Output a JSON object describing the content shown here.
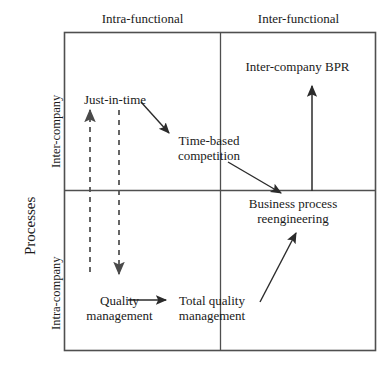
{
  "diagram": {
    "title_axis_y": "Processes",
    "axis_y_categories": [
      {
        "id": "inter-company",
        "label": "Inter-company"
      },
      {
        "id": "intra-company",
        "label": "Intra-company"
      }
    ],
    "axis_x_categories": [
      {
        "id": "intra-functional",
        "label": "Intra-functional"
      },
      {
        "id": "inter-functional",
        "label": "Inter-functional"
      }
    ],
    "nodes": [
      {
        "id": "just-in-time",
        "label": "Just-in-time"
      },
      {
        "id": "time-based-competition",
        "line1": "Time-based",
        "line2": "competition"
      },
      {
        "id": "inter-company-bpr",
        "label": "Inter-company BPR"
      },
      {
        "id": "business-process-reengineering",
        "line1": "Business process",
        "line2": "reengineering"
      },
      {
        "id": "quality-management",
        "line1": "Quality",
        "line2": "management"
      },
      {
        "id": "total-quality-management",
        "line1": "Total quality",
        "line2": "management"
      }
    ],
    "connectors": [
      {
        "id": "quality-to-total-quality",
        "style": "solid",
        "from": "quality-management",
        "to": "total-quality-management"
      },
      {
        "id": "total-quality-to-just-in-time",
        "style": "dashed",
        "from": "total-quality-management",
        "to": "just-in-time"
      },
      {
        "id": "just-in-time-down",
        "style": "dashed",
        "from": "just-in-time",
        "to": "quality-management"
      },
      {
        "id": "just-in-time-to-time-based",
        "style": "solid",
        "from": "just-in-time",
        "to": "time-based-competition"
      },
      {
        "id": "time-based-to-bpr",
        "style": "solid",
        "from": "time-based-competition",
        "to": "business-process-reengineering"
      },
      {
        "id": "tqm-to-bpr",
        "style": "solid",
        "from": "total-quality-management",
        "to": "business-process-reengineering"
      },
      {
        "id": "bpr-to-inter-company-bpr",
        "style": "solid",
        "from": "business-process-reengineering",
        "to": "inter-company-bpr"
      }
    ],
    "colors": {
      "line": "#3a3a3a",
      "text": "#1a1a1a",
      "background": "#ffffff"
    }
  }
}
